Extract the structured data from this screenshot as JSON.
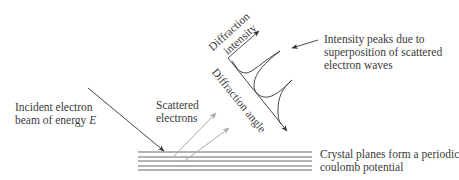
{
  "diagram": {
    "labels": {
      "incident_line1": "Incident electron",
      "incident_line2": "beam of energy ",
      "incident_energy_symbol": "E",
      "scattered_line1": "Scattered",
      "scattered_line2": "electrons",
      "intensity_axis_line1": "Diffraction",
      "intensity_axis_line2": "intensity",
      "angle_axis": "Diffraction angle",
      "peaks_line1": "Intensity peaks due to",
      "peaks_line2": "superposition of scattered",
      "peaks_line3": "electron waves",
      "crystal_line1": "Crystal planes form a periodic",
      "crystal_line2": "coulomb potential"
    },
    "colors": {
      "text": "#3a3a3a",
      "incident_arrow": "#333333",
      "scattered_arrows": "#aaaaaa",
      "axes": "#333333",
      "crystal_planes": "#555555"
    },
    "crystal_plane_count": 5,
    "scattered_arrow_count": 2,
    "intensity_peak_count": 2
  }
}
